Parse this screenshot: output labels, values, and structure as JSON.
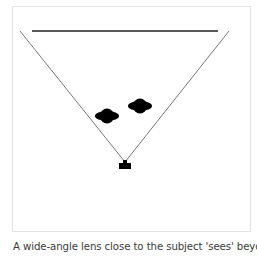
{
  "diagram": {
    "type": "lens field-of-view illustration",
    "elements": [
      {
        "name": "background-plane",
        "shape": "horizontal-line"
      },
      {
        "name": "field-of-view",
        "shape": "v-lines",
        "description": "wide angle"
      },
      {
        "name": "subject-1",
        "shape": "blob"
      },
      {
        "name": "subject-2",
        "shape": "blob"
      },
      {
        "name": "camera",
        "shape": "camera-glyph"
      }
    ],
    "colors": {
      "lines": "#555555",
      "background_line": "#222222",
      "subjects": "#000000",
      "frame_border": "#e2e2e2"
    }
  },
  "caption": {
    "text": "A wide-angle lens close to the subject 'sees' beyond the"
  }
}
